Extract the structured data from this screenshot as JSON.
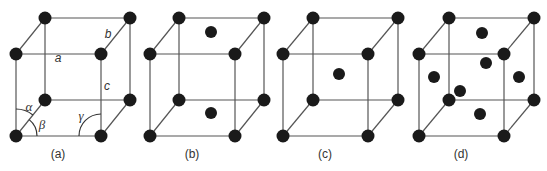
{
  "figure": {
    "panels": [
      {
        "id": "a",
        "label": "(a)",
        "type": "primitive-with-parameters",
        "origin": {
          "fx": 16,
          "bx": 45
        },
        "edge_labels": {
          "a": "a",
          "b": "b",
          "c": "c"
        },
        "angle_labels": {
          "alpha": "α",
          "beta": "β",
          "gamma": "γ"
        },
        "extra_atoms": []
      },
      {
        "id": "b",
        "label": "(b)",
        "type": "base-centered",
        "origin": {
          "fx": 150,
          "bx": 179
        },
        "extra_atoms": [
          {
            "x": 211,
            "y": 32
          },
          {
            "x": 211,
            "y": 113
          }
        ]
      },
      {
        "id": "c",
        "label": "(c)",
        "type": "body-centered",
        "origin": {
          "fx": 283,
          "bx": 313
        },
        "extra_atoms": [
          {
            "x": 339,
            "y": 74
          }
        ]
      },
      {
        "id": "d",
        "label": "(d)",
        "type": "face-centered",
        "origin": {
          "fx": 419,
          "bx": 449
        },
        "extra_atoms": [
          {
            "x": 482,
            "y": 33
          },
          {
            "x": 486,
            "y": 63
          },
          {
            "x": 434,
            "y": 77
          },
          {
            "x": 519,
            "y": 77
          },
          {
            "x": 460,
            "y": 91
          },
          {
            "x": 480,
            "y": 114
          }
        ]
      }
    ],
    "geometry": {
      "front_width": 85,
      "depth_dx": 29,
      "depth_dy": 36,
      "back_top_y": 18,
      "front_top_y": 54,
      "back_bottom_y": 100,
      "front_bottom_y": 136,
      "atom_radius": 6.5
    },
    "colors": {
      "edge": "#555555",
      "atom": "#1a1a1a",
      "text": "#333333",
      "background": "#ffffff"
    }
  }
}
